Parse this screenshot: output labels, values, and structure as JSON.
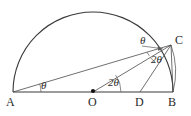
{
  "figure": {
    "stroke_color": "#3a3a3a",
    "text_color": "#2a2a2a",
    "background_color": "#ffffff",
    "width": 191,
    "height": 116
  },
  "points": [
    {
      "id": "A",
      "label": "A",
      "x": 13,
      "y": 92,
      "label_x": 6,
      "label_y": 96
    },
    {
      "id": "O",
      "label": "O",
      "x": 93,
      "y": 92,
      "label_x": 88,
      "label_y": 96
    },
    {
      "id": "D",
      "label": "D",
      "x": 140,
      "y": 92,
      "label_x": 135,
      "label_y": 96
    },
    {
      "id": "B",
      "label": "B",
      "x": 173,
      "y": 92,
      "label_x": 168,
      "label_y": 96
    },
    {
      "id": "C",
      "label": "C",
      "x": 171,
      "y": 45,
      "label_x": 175,
      "label_y": 34
    }
  ],
  "angles": [
    {
      "id": "angle-at-a",
      "label": "θ",
      "x": 41,
      "y": 80,
      "vertex": "A"
    },
    {
      "id": "angle-at-o",
      "label": "2θ",
      "x": 108,
      "y": 77,
      "vertex": "O"
    },
    {
      "id": "angle-at-c-lower",
      "label": "2θ",
      "x": 151,
      "y": 54,
      "vertex": "C"
    },
    {
      "id": "angle-at-c-upper",
      "label": "θ",
      "x": 140,
      "y": 35,
      "vertex": "C"
    }
  ],
  "segments": [
    {
      "id": "diameter-ab",
      "from": "A",
      "to": "B"
    },
    {
      "id": "chord-ac",
      "from": "A",
      "to": "C"
    },
    {
      "id": "radius-oc",
      "from": "O",
      "to": "C"
    },
    {
      "id": "segment-dc",
      "from": "D",
      "to": "C"
    },
    {
      "id": "chord-cb",
      "from": "C",
      "to": "B"
    }
  ],
  "arcs": [
    {
      "id": "semicircle-arc",
      "center": "O",
      "radius": 80,
      "from_deg": 180,
      "to_deg": 0
    },
    {
      "id": "minor-arc-cb",
      "center": "O",
      "radius": 80,
      "from_deg": 36,
      "to_deg": 0
    }
  ],
  "markers": [
    {
      "id": "center-dot",
      "x": 93,
      "y": 91,
      "r": 2.1
    }
  ],
  "leader": {
    "id": "theta-leader-arrow",
    "from_x": 142,
    "from_y": 46,
    "to_x": 163,
    "to_y": 48
  }
}
